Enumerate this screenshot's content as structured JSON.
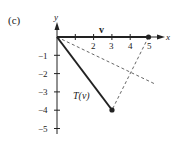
{
  "panel_label": "(c)",
  "axes": {
    "x_label": "x",
    "y_label": "y",
    "x_ticks": [
      "1",
      "2",
      "3",
      "4",
      "5"
    ],
    "y_ticks": [
      "−1",
      "−2",
      "−3",
      "−4",
      "−5"
    ]
  },
  "vectors": {
    "v_label": "v",
    "v_end": [
      5,
      0
    ],
    "tv_label": "T(v)",
    "tv_end": [
      3,
      -4
    ]
  },
  "guides": {
    "reflection_line_end": [
      5.4,
      -2.6
    ],
    "connector": [
      [
        5,
        0
      ],
      [
        3,
        -4
      ]
    ]
  },
  "colors": {
    "ink": "#222222",
    "dashed": "#555555"
  }
}
